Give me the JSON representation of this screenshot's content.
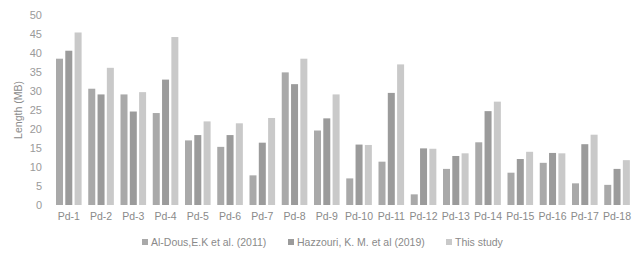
{
  "chart_data": {
    "type": "bar",
    "title": "",
    "xlabel": "",
    "ylabel": "Length (MB)",
    "ylim": [
      0,
      50
    ],
    "yticks": [
      0,
      5,
      10,
      15,
      20,
      25,
      30,
      35,
      40,
      45,
      50
    ],
    "grid": false,
    "legend_position": "bottom",
    "categories": [
      "Pd-1",
      "Pd-2",
      "Pd-3",
      "Pd-4",
      "Pd-5",
      "Pd-6",
      "Pd-7",
      "Pd-8",
      "Pd-9",
      "Pd-10",
      "Pd-11",
      "Pd-12",
      "Pd-13",
      "Pd-14",
      "Pd-15",
      "Pd-16",
      "Pd-17",
      "Pd-18"
    ],
    "series": [
      {
        "name": "Al-Dous,E.K et al. (2011)",
        "color": "#a9a9a9",
        "values": [
          38.5,
          30.6,
          29.1,
          24.2,
          17.0,
          15.3,
          7.8,
          34.9,
          19.6,
          7.0,
          11.4,
          2.8,
          9.5,
          16.5,
          8.5,
          11.1,
          5.7,
          5.3
        ]
      },
      {
        "name": "Hazzouri, K. M. et al (2019)",
        "color": "#9b9b9b",
        "values": [
          40.6,
          29.1,
          24.6,
          33.0,
          18.4,
          18.4,
          16.4,
          31.8,
          22.8,
          15.9,
          29.5,
          14.9,
          12.9,
          24.7,
          12.1,
          13.7,
          16.0,
          9.5
        ]
      },
      {
        "name": "This study",
        "color": "#c9c9c9",
        "values": [
          45.4,
          36.1,
          29.7,
          44.2,
          22.0,
          21.5,
          22.9,
          38.5,
          29.1,
          15.8,
          37.0,
          14.8,
          13.6,
          27.2,
          14.0,
          13.6,
          18.5,
          11.8
        ]
      }
    ]
  }
}
